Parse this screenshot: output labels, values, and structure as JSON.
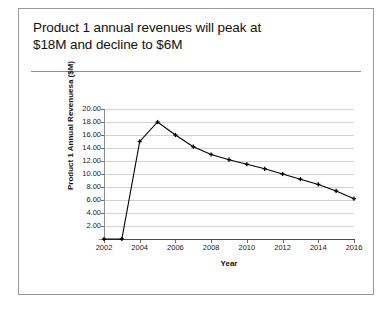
{
  "slide": {
    "title_line_1": "Product 1 annual revenues will peak at",
    "title_line_2": "$18M and decline to $6M"
  },
  "chart_data": {
    "type": "line",
    "title": "",
    "xlabel": "Year",
    "ylabel": "Product 1 Annual Revenuesa ($M)",
    "x": [
      2002,
      2003,
      2004,
      2005,
      2006,
      2007,
      2008,
      2009,
      2010,
      2011,
      2012,
      2013,
      2014,
      2015,
      2016
    ],
    "values": [
      0,
      0,
      15.0,
      18.0,
      16.0,
      14.2,
      13.0,
      12.2,
      11.5,
      10.8,
      10.0,
      9.2,
      8.4,
      7.4,
      6.2
    ],
    "series": [
      {
        "name": "Product 1 Annual Revenues",
        "values": [
          0,
          0,
          15.0,
          18.0,
          16.0,
          14.2,
          13.0,
          12.2,
          11.5,
          10.8,
          10.0,
          9.2,
          8.4,
          7.4,
          6.2
        ]
      }
    ],
    "ylim": [
      0,
      20
    ],
    "xlim": [
      2002,
      2016
    ],
    "ytick_values": [
      0,
      2,
      4,
      6,
      8,
      10,
      12,
      14,
      16,
      18,
      20
    ],
    "ytick_labels": [
      "-",
      "2.00",
      "4.00",
      "6.00",
      "8.00",
      "10.00",
      "12.00",
      "14.00",
      "16.00",
      "18.00",
      "20.00"
    ],
    "xtick_values": [
      2002,
      2004,
      2006,
      2008,
      2010,
      2012,
      2014,
      2016
    ],
    "xtick_labels": [
      "2002",
      "2004",
      "2006",
      "2008",
      "2010",
      "2012",
      "2014",
      "2016"
    ],
    "grid": true,
    "grid_axis": "y",
    "legend": false,
    "legend_position": "none",
    "line_color": "#000000",
    "marker": "plus-cross",
    "marker_color": "#000000"
  }
}
